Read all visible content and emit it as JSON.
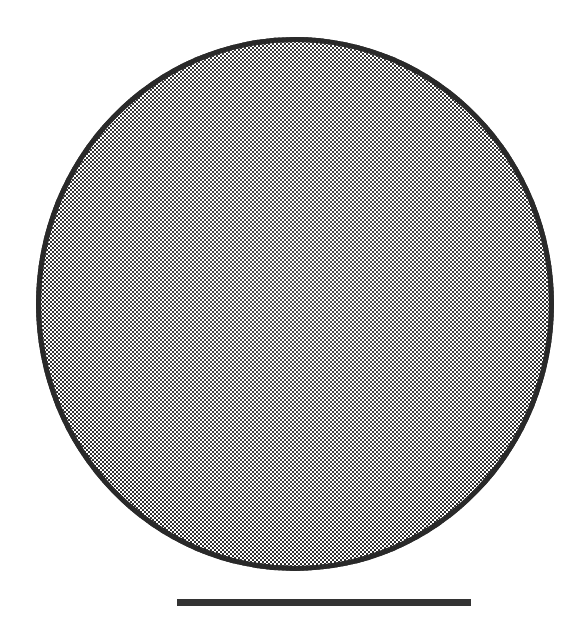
{
  "figure": {
    "type": "micrograph",
    "title": "",
    "caption": "",
    "background_color": "#ffffff",
    "width_px": 582,
    "height_px": 628
  },
  "specimen": {
    "name": "circular-specimen",
    "shape": "circle",
    "fill_style": "checkerboard-dither",
    "fill_description": "2 px black-and-white checkerboard halftone",
    "dither_dark_color": "#262626",
    "dither_light_color": "#ffffff",
    "outline_color": "#2a2a2a",
    "outline_width_px": 5,
    "left_px": 36,
    "top_px": 37,
    "width_px": 518,
    "height_px": 534
  },
  "scale_bar": {
    "name": "scale-bar",
    "label": "",
    "color": "#333333",
    "left_px": 177,
    "top_px": 599,
    "width_px": 294,
    "height_px": 7
  }
}
